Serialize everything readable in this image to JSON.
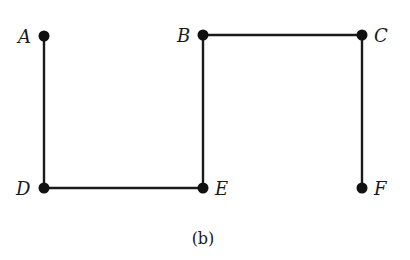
{
  "diagram": {
    "type": "graph",
    "caption": "(b)",
    "edge_color": "#1a1a1a",
    "node_color": "#111111",
    "nodes": [
      {
        "id": "A",
        "label": "A",
        "x": 44,
        "y": 36
      },
      {
        "id": "B",
        "label": "B",
        "x": 203,
        "y": 35
      },
      {
        "id": "C",
        "label": "C",
        "x": 362,
        "y": 35
      },
      {
        "id": "D",
        "label": "D",
        "x": 44,
        "y": 188
      },
      {
        "id": "E",
        "label": "E",
        "x": 203,
        "y": 188
      },
      {
        "id": "F",
        "label": "F",
        "x": 362,
        "y": 188
      }
    ],
    "edges": [
      {
        "from": "A",
        "to": "D"
      },
      {
        "from": "D",
        "to": "E"
      },
      {
        "from": "E",
        "to": "B"
      },
      {
        "from": "B",
        "to": "C"
      },
      {
        "from": "C",
        "to": "F"
      }
    ]
  }
}
